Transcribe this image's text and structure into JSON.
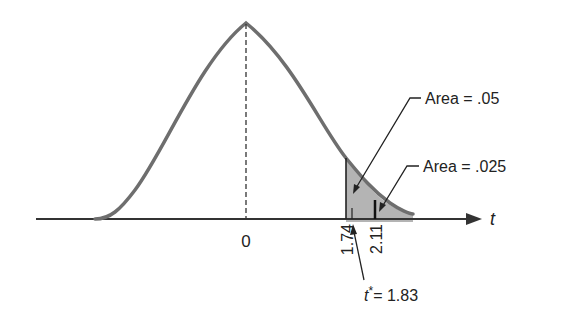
{
  "diagram": {
    "type": "t-distribution density curve with shaded right tail",
    "axis_label": "t",
    "center_label": "0",
    "critical_values": [
      {
        "label": "1.74",
        "value": 1.74
      },
      {
        "label": "2.11",
        "value": 2.11
      }
    ],
    "annotations": [
      {
        "text": "Area = .05",
        "points_to": "region right of 1.74"
      },
      {
        "text": "Area = .025",
        "points_to": "region right of 2.11"
      },
      {
        "text_italic": "t",
        "text_sup": "*",
        "text_rest": "= 1.83",
        "points_to": "t* = 1.83 on axis"
      }
    ],
    "colors": {
      "curve": "#6e6e6e",
      "shade": "#b4b4b4",
      "axis": "#333333",
      "text": "#222222"
    }
  }
}
